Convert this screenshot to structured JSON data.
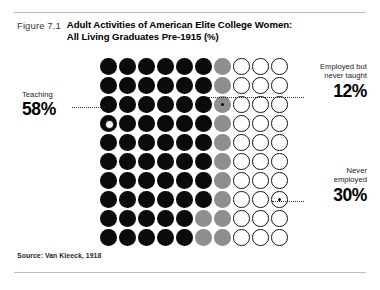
{
  "figure": {
    "number": "Figure 7.1",
    "title_line1": "Adult Activities of American Elite College Women:",
    "title_line2": "All Living Graduates Pre-1915 (%)",
    "source": "Source: Van Kleeck, 1918"
  },
  "callouts": {
    "teaching": {
      "label": "Teaching",
      "value": "58%"
    },
    "employed": {
      "label_line1": "Employed but",
      "label_line2": "never taught",
      "value": "12%"
    },
    "never": {
      "label_line1": "Never",
      "label_line2": "employed",
      "value": "30%"
    }
  },
  "colors": {
    "teaching": "#0b0b0b",
    "employed": "#8e8e8e",
    "never_employed": "#ffffff",
    "outline": "#141414",
    "rule": "#b9bcc0"
  },
  "chart_data": {
    "type": "pie",
    "subtype": "waffle-dot-matrix",
    "title": "Adult Activities of American Elite College Women: All Living Graduates Pre-1915 (%)",
    "xlabel": "",
    "ylabel": "",
    "grid": {
      "rows": 10,
      "columns": 10,
      "total_dots": 100,
      "unit": "1 dot = 1%"
    },
    "categories": [
      "Teaching",
      "Employed but never taught",
      "Never employed"
    ],
    "values": [
      58,
      12,
      30
    ],
    "series": [
      {
        "name": "Teaching",
        "value": 58,
        "color": "#0b0b0b",
        "style": "filled-black"
      },
      {
        "name": "Employed but never taught",
        "value": 12,
        "color": "#8e8e8e",
        "style": "filled-gray"
      },
      {
        "name": "Never employed",
        "value": 30,
        "color": "#ffffff",
        "style": "open-circle"
      }
    ],
    "legend_position": "callout-annotations",
    "rows": [
      [
        "black",
        "black",
        "black",
        "black",
        "black",
        "black",
        "gray",
        "white",
        "white",
        "white"
      ],
      [
        "black",
        "black",
        "black",
        "black",
        "black",
        "black",
        "gray",
        "white",
        "white",
        "white"
      ],
      [
        "black",
        "black",
        "black",
        "black",
        "black",
        "black",
        "gray",
        "white",
        "white",
        "white"
      ],
      [
        "black",
        "black",
        "black",
        "black",
        "black",
        "black",
        "gray",
        "white",
        "white",
        "white"
      ],
      [
        "black",
        "black",
        "black",
        "black",
        "black",
        "black",
        "gray",
        "white",
        "white",
        "white"
      ],
      [
        "black",
        "black",
        "black",
        "black",
        "black",
        "black",
        "gray",
        "white",
        "white",
        "white"
      ],
      [
        "black",
        "black",
        "black",
        "black",
        "black",
        "black",
        "gray",
        "white",
        "white",
        "white"
      ],
      [
        "black",
        "black",
        "black",
        "black",
        "black",
        "black",
        "gray",
        "white",
        "white",
        "white"
      ],
      [
        "black",
        "black",
        "black",
        "black",
        "black",
        "gray",
        "gray",
        "white",
        "white",
        "white"
      ],
      [
        "black",
        "black",
        "black",
        "black",
        "black",
        "gray",
        "gray",
        "white",
        "white",
        "white"
      ]
    ],
    "annotations": [
      {
        "text": "58%",
        "label": "Teaching",
        "attaches_to": {
          "row": 4,
          "col": 1
        },
        "side": "left"
      },
      {
        "text": "12%",
        "label": "Employed but never taught",
        "attaches_to": {
          "row": 3,
          "col": 7
        },
        "side": "right"
      },
      {
        "text": "30%",
        "label": "Never employed",
        "attaches_to": {
          "row": 8,
          "col": 10
        },
        "side": "right"
      }
    ]
  }
}
